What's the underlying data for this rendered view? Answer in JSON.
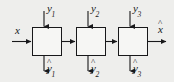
{
  "diagram": {
    "type": "block-diagram",
    "background_color": "#eeeeec",
    "line_color": "#18181a",
    "block_fill": "#f6f6f4",
    "blocks": [
      {
        "id": "block-1",
        "label": ""
      },
      {
        "id": "block-2",
        "label": ""
      },
      {
        "id": "block-3",
        "label": ""
      }
    ],
    "labels": {
      "input_x": {
        "base": "x",
        "hat": false,
        "subscript": ""
      },
      "output_xhat": {
        "base": "x",
        "hat": true,
        "subscript": ""
      },
      "top_inputs": [
        {
          "base": "y",
          "hat": false,
          "subscript": "1"
        },
        {
          "base": "y",
          "hat": false,
          "subscript": "2"
        },
        {
          "base": "y",
          "hat": false,
          "subscript": "3"
        }
      ],
      "bottom_outputs": [
        {
          "base": "y",
          "hat": true,
          "subscript": "1"
        },
        {
          "base": "y",
          "hat": true,
          "subscript": "2"
        },
        {
          "base": "y",
          "hat": true,
          "subscript": "3"
        }
      ]
    },
    "hat_glyph": "^"
  }
}
